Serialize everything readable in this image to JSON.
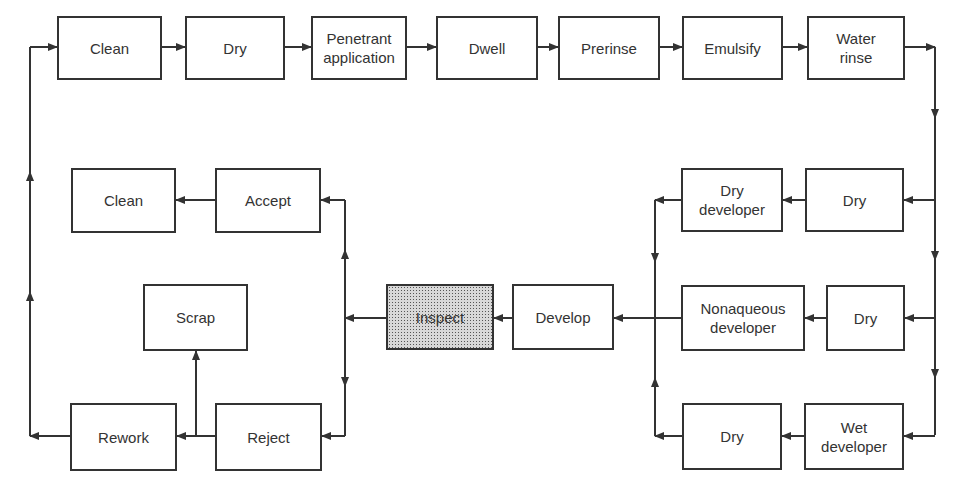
{
  "diagram": {
    "title": "",
    "type": "flowchart",
    "nodes": [
      {
        "id": "clean1",
        "label": "Clean",
        "x": 57,
        "y": 16,
        "w": 105,
        "h": 64
      },
      {
        "id": "dry1",
        "label": "Dry",
        "x": 185,
        "y": 16,
        "w": 100,
        "h": 64
      },
      {
        "id": "penetrant",
        "label": "Penetrant\napplication",
        "x": 311,
        "y": 16,
        "w": 96,
        "h": 64
      },
      {
        "id": "dwell",
        "label": "Dwell",
        "x": 436,
        "y": 16,
        "w": 102,
        "h": 64
      },
      {
        "id": "prerinse",
        "label": "Prerinse",
        "x": 558,
        "y": 16,
        "w": 102,
        "h": 64
      },
      {
        "id": "emulsify",
        "label": "Emulsify",
        "x": 682,
        "y": 16,
        "w": 101,
        "h": 64
      },
      {
        "id": "water_rinse",
        "label": "Water\nrinse",
        "x": 807,
        "y": 16,
        "w": 98,
        "h": 64
      },
      {
        "id": "dry_a",
        "label": "Dry",
        "x": 805,
        "y": 168,
        "w": 99,
        "h": 64
      },
      {
        "id": "dry_developer",
        "label": "Dry\ndeveloper",
        "x": 681,
        "y": 168,
        "w": 102,
        "h": 64
      },
      {
        "id": "dry_b",
        "label": "Dry",
        "x": 826,
        "y": 285,
        "w": 79,
        "h": 66
      },
      {
        "id": "nonaqueous",
        "label": "Nonaqueous\ndeveloper",
        "x": 681,
        "y": 285,
        "w": 124,
        "h": 66
      },
      {
        "id": "wet_developer",
        "label": "Wet\ndeveloper",
        "x": 804,
        "y": 403,
        "w": 100,
        "h": 67
      },
      {
        "id": "dry_c",
        "label": "Dry",
        "x": 682,
        "y": 403,
        "w": 100,
        "h": 67
      },
      {
        "id": "develop",
        "label": "Develop",
        "x": 512,
        "y": 284,
        "w": 102,
        "h": 66
      },
      {
        "id": "inspect",
        "label": "Inspect",
        "x": 386,
        "y": 284,
        "w": 108,
        "h": 66,
        "highlight": true
      },
      {
        "id": "accept",
        "label": "Accept",
        "x": 215,
        "y": 168,
        "w": 106,
        "h": 65
      },
      {
        "id": "clean2",
        "label": "Clean",
        "x": 71,
        "y": 168,
        "w": 105,
        "h": 65
      },
      {
        "id": "scrap",
        "label": "Scrap",
        "x": 143,
        "y": 284,
        "w": 105,
        "h": 67
      },
      {
        "id": "reject",
        "label": "Reject",
        "x": 215,
        "y": 403,
        "w": 107,
        "h": 68
      },
      {
        "id": "rework",
        "label": "Rework",
        "x": 70,
        "y": 403,
        "w": 107,
        "h": 68
      }
    ],
    "edges": [
      [
        "clean1",
        "dry1"
      ],
      [
        "dry1",
        "penetrant"
      ],
      [
        "penetrant",
        "dwell"
      ],
      [
        "dwell",
        "prerinse"
      ],
      [
        "prerinse",
        "emulsify"
      ],
      [
        "emulsify",
        "water_rinse"
      ],
      [
        "water_rinse",
        "dry_a"
      ],
      [
        "water_rinse",
        "dry_b"
      ],
      [
        "water_rinse",
        "wet_developer"
      ],
      [
        "dry_a",
        "dry_developer"
      ],
      [
        "dry_b",
        "nonaqueous"
      ],
      [
        "wet_developer",
        "dry_c"
      ],
      [
        "dry_developer",
        "develop"
      ],
      [
        "nonaqueous",
        "develop"
      ],
      [
        "dry_c",
        "develop"
      ],
      [
        "develop",
        "inspect"
      ],
      [
        "inspect",
        "accept"
      ],
      [
        "inspect",
        "reject"
      ],
      [
        "accept",
        "clean2"
      ],
      [
        "reject",
        "rework"
      ],
      [
        "reject",
        "scrap"
      ],
      [
        "rework",
        "clean1"
      ]
    ],
    "line_color": "#333333",
    "stipple_color": "#555555"
  }
}
